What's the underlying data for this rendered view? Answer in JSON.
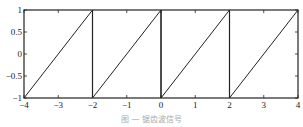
{
  "chart_data": {
    "type": "line",
    "title": "",
    "xlabel": "",
    "ylabel": "",
    "xlim": [
      -4,
      4
    ],
    "ylim": [
      -1,
      1
    ],
    "grid": false,
    "legend": null,
    "x_ticks": [
      -4,
      -3,
      -2,
      -1,
      0,
      1,
      2,
      3,
      4
    ],
    "x_tick_labels": [
      "−4",
      "−3",
      "−2",
      "−1",
      "0",
      "1",
      "2",
      "3",
      "4"
    ],
    "y_ticks": [
      -1,
      -0.5,
      0,
      0.5,
      1
    ],
    "y_tick_labels": [
      "−1",
      "−0.5",
      "0",
      "0.5",
      "1"
    ],
    "series": [
      {
        "name": "sawtooth",
        "color": "#222222",
        "x": [
          -4,
          -2,
          -2,
          0,
          0,
          2,
          2,
          4
        ],
        "y": [
          -1,
          1,
          -1,
          1,
          -1,
          1,
          -1,
          1
        ]
      }
    ],
    "vertical_lines_x": [
      -2,
      0,
      2
    ]
  },
  "caption": "图 — 锯齿波信号"
}
